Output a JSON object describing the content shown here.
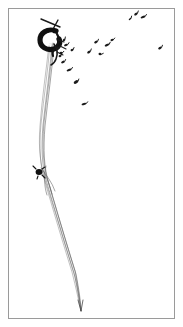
{
  "figure": {
    "title": "Kite with string and scattered flying specks",
    "medium": "black ink line drawing on white paper, scanned",
    "background_color": "#ffffff",
    "ink_color": "#1a1a1a",
    "line_color": "#555555",
    "frame": {
      "name": "rectangular-border",
      "stroke_color": "#9a9a9a",
      "stroke_width": 1,
      "x": 8,
      "y": 8,
      "width": 167,
      "height": 311
    },
    "canvas": {
      "width": 183,
      "height": 327
    }
  },
  "elements": {
    "crossbar": {
      "label": "kite-crossbar-stroke",
      "description": "short diagonal stroke above the dark loop",
      "path": "M 41 19 L 60 27 M 58 20 L 52 31"
    },
    "top_knot": {
      "label": "dark-loop-knot",
      "description": "heavy black curled loop at the top of the string",
      "cx": 50,
      "cy": 38,
      "rx": 7,
      "ry": 7
    },
    "mid_knot": {
      "label": "small-dark-knot",
      "description": "small solid black node on the left of the strand bundle",
      "cx": 39,
      "cy": 172,
      "r": 3.2
    },
    "string_bundle": {
      "label": "string-strand-bundle",
      "strand_count": 5,
      "description": "bundle of fine near-parallel strands descending and tapering to a point",
      "tail_point_x": 81,
      "tail_point_y": 311
    }
  },
  "strand_paths": [
    "M 50 44 C 48 70, 44 96, 41 124 C 39 148, 40 166, 45 182 C 52 206, 62 240, 72 272 C 76 288, 79 302, 81 311",
    "M 52 44 C 50 70, 46 97, 43 125 C 41 149, 42 167, 47 183 C 54 207, 64 241, 74 273 C 78 289, 80 303, 81 311",
    "M 54 45 C 52 71, 48 98, 45 126 C 43 150, 44 168, 49 184 C 56 208, 66 242, 76 274 C 79 290, 81 304, 81 311",
    "M 49 45 C 46 72, 42 98, 40 126 C 38 150, 41 169, 47 186 C 55 211, 65 245, 75 277 C 78 292, 80 305, 81 311",
    "M 53 43 C 51 69, 47 95, 44 123 C 42 147, 43 165, 48 181 C 55 205, 65 239, 75 271 C 78 287, 80 301, 81 311"
  ],
  "mid_crossover_paths": [
    "M 41 168 C 46 175, 52 182, 55 191",
    "M 43 170 C 47 178, 50 186, 52 194",
    "M 46 166 C 44 176, 44 186, 47 195"
  ],
  "specks": [
    {
      "name": "speck",
      "x": 136,
      "y": 14,
      "w": 4,
      "h": 3,
      "rot": -35
    },
    {
      "name": "speck",
      "x": 143,
      "y": 17,
      "w": 5,
      "h": 3,
      "rot": -20
    },
    {
      "name": "speck",
      "x": 130,
      "y": 19,
      "w": 3,
      "h": 2,
      "rot": -40
    },
    {
      "name": "speck",
      "x": 96,
      "y": 42,
      "w": 4,
      "h": 3,
      "rot": -30
    },
    {
      "name": "speck",
      "x": 107,
      "y": 45,
      "w": 5,
      "h": 3,
      "rot": -25
    },
    {
      "name": "speck",
      "x": 112,
      "y": 40,
      "w": 3,
      "h": 3,
      "rot": -15
    },
    {
      "name": "speck",
      "x": 89,
      "y": 52,
      "w": 4,
      "h": 3,
      "rot": -35
    },
    {
      "name": "speck",
      "x": 100,
      "y": 54,
      "w": 3,
      "h": 3,
      "rot": 10
    },
    {
      "name": "speck",
      "x": 160,
      "y": 48,
      "w": 4,
      "h": 3,
      "rot": -30
    },
    {
      "name": "speck",
      "x": 66,
      "y": 45,
      "w": 4,
      "h": 3,
      "rot": -20
    },
    {
      "name": "speck",
      "x": 72,
      "y": 50,
      "w": 3,
      "h": 3,
      "rot": -30
    },
    {
      "name": "speck",
      "x": 63,
      "y": 62,
      "w": 4,
      "h": 3,
      "rot": -25
    },
    {
      "name": "speck",
      "x": 69,
      "y": 70,
      "w": 5,
      "h": 3,
      "rot": -20
    },
    {
      "name": "speck",
      "x": 76,
      "y": 82,
      "w": 5,
      "h": 4,
      "rot": -30
    },
    {
      "name": "speck",
      "x": 84,
      "y": 104,
      "w": 5,
      "h": 3,
      "rot": -15
    },
    {
      "name": "speck",
      "x": 61,
      "y": 53,
      "w": 3,
      "h": 3,
      "rot": -10
    },
    {
      "name": "speck",
      "x": 64,
      "y": 40,
      "w": 3,
      "h": 3,
      "rot": -45
    },
    {
      "name": "speck",
      "x": 58,
      "y": 48,
      "w": 3,
      "h": 4,
      "rot": -20
    },
    {
      "name": "speck",
      "x": 60,
      "y": 56,
      "w": 3,
      "h": 3,
      "rot": -35
    }
  ]
}
